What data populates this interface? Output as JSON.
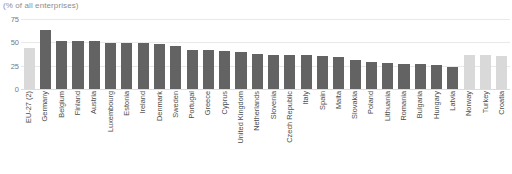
{
  "chart_data": {
    "type": "bar",
    "title": "",
    "subtitle": "(% of all enterprises)",
    "xlabel": "",
    "ylabel": "",
    "ylim": [
      0,
      80
    ],
    "yticks": [
      0,
      25,
      50,
      75
    ],
    "grid": true,
    "legend": false,
    "categories": [
      "EU-27 (2)",
      "Germany",
      "Belgium",
      "Finland",
      "Austria",
      "Luxembourg",
      "Estonia",
      "Ireland",
      "Denmark",
      "Sweden",
      "Portugal",
      "Greece",
      "Cyprus",
      "United Kingdom",
      "Netherlands",
      "Slovenia",
      "Czech Republic",
      "Italy",
      "Spain",
      "Malta",
      "Slovakia",
      "Poland",
      "Lithuania",
      "Romania",
      "Bulgaria",
      "Hungary",
      "Latvia",
      "Norway",
      "Turkey",
      "Croatia"
    ],
    "values": [
      44,
      63,
      51,
      51,
      51,
      49,
      49,
      49,
      48,
      46,
      42,
      42,
      41,
      40,
      37,
      36,
      36,
      36,
      35,
      34,
      31,
      29,
      28,
      27,
      27,
      26,
      23,
      36,
      36,
      35
    ],
    "bar_styles": [
      "light",
      "dark",
      "dark",
      "dark",
      "dark",
      "dark",
      "dark",
      "dark",
      "dark",
      "dark",
      "dark",
      "dark",
      "dark",
      "dark",
      "dark",
      "dark",
      "dark",
      "dark",
      "dark",
      "dark",
      "dark",
      "dark",
      "dark",
      "dark",
      "dark",
      "dark",
      "dark",
      "light",
      "light",
      "light"
    ],
    "colors": {
      "bar_dark": "#636363",
      "bar_light": "#d9d9d9",
      "gridline": "#e9e9e9",
      "zero_line": "#dcdcdc",
      "tick_text": "#7a7a7a",
      "category_text": "#4d4d4d",
      "subtitle_text": "#8c8c8c",
      "background": "#ffffff"
    }
  }
}
